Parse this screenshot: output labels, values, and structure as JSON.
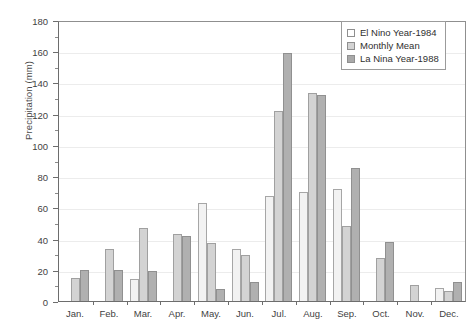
{
  "chart_data": {
    "type": "bar",
    "title": "",
    "xlabel": "",
    "ylabel": "Precipitation (mm)",
    "ylim": [
      0,
      180
    ],
    "ytick_step": 20,
    "yticks": [
      0,
      20,
      40,
      60,
      80,
      100,
      120,
      140,
      160,
      180
    ],
    "ytick_labels": [
      "0",
      "20",
      "40",
      "60",
      "80",
      "100",
      "120",
      "140",
      "160",
      "180"
    ],
    "grid": true,
    "grid_axis": "y",
    "legend_position": "top-right",
    "categories": [
      "Jan.",
      "Feb.",
      "Mar.",
      "Apr.",
      "May.",
      "Jun.",
      "Jul.",
      "Aug.",
      "Sep.",
      "Oct.",
      "Nov.",
      "Dec."
    ],
    "series": [
      {
        "name": "El Nino Year-1984",
        "color": "#f2f2f2",
        "values": [
          null,
          null,
          14,
          null,
          63,
          33.5,
          67,
          70,
          72,
          null,
          null,
          8.5
        ]
      },
      {
        "name": "Monthly Mean",
        "color": "#d3d3d3",
        "values": [
          15,
          33,
          47,
          43,
          37,
          29.5,
          122,
          133,
          48,
          27.5,
          10,
          6.5
        ]
      },
      {
        "name": "La Nina Year-1988",
        "color": "#b0b0b0",
        "values": [
          20,
          20,
          19.5,
          41.5,
          8,
          12,
          159,
          132,
          85,
          37.5,
          null,
          12.5
        ]
      }
    ]
  },
  "legend": {
    "items": [
      {
        "label": "El Nino Year-1984"
      },
      {
        "label": "Monthly Mean"
      },
      {
        "label": "La Nina Year-1988"
      }
    ]
  },
  "axes": {
    "y_title": "Precipitation (mm)"
  }
}
